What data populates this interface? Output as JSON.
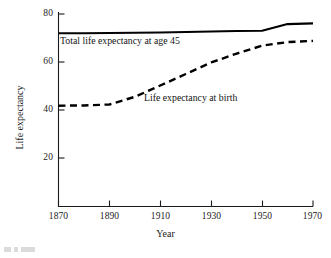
{
  "chart_data": {
    "type": "line",
    "title": "",
    "xlabel": "Year",
    "ylabel": "Life expectancy",
    "xlim": [
      1865,
      1972
    ],
    "ylim": [
      0,
      85
    ],
    "xticks": [
      1870,
      1890,
      1910,
      1930,
      1950,
      1970
    ],
    "xtick_labels": [
      "1870",
      "1890",
      "1910",
      "1930",
      "1950",
      "1970"
    ],
    "yticks": [
      20,
      40,
      60,
      80
    ],
    "ytick_labels": [
      "20",
      "40",
      "60",
      "80"
    ],
    "grid": false,
    "legend_position": "inline-annotation",
    "series": [
      {
        "name": "Total life expectancy at age 45",
        "style": "solid",
        "color": "#000000",
        "annotation": "Total life expectancy at age 45",
        "x": [
          1870,
          1880,
          1890,
          1900,
          1910,
          1920,
          1930,
          1940,
          1950,
          1960,
          1970
        ],
        "values": [
          72.0,
          72.0,
          72.1,
          72.2,
          72.3,
          72.5,
          72.7,
          72.9,
          73.0,
          75.8,
          76.1
        ]
      },
      {
        "name": "Life expectancy at birth",
        "style": "dashed",
        "color": "#000000",
        "annotation": "Life expectancy at birth",
        "x": [
          1870,
          1880,
          1890,
          1900,
          1910,
          1920,
          1930,
          1940,
          1950,
          1960,
          1970
        ],
        "values": [
          41.8,
          41.9,
          42.3,
          45.5,
          50.2,
          55.0,
          59.8,
          63.5,
          66.8,
          68.3,
          68.8
        ]
      }
    ]
  },
  "axis": {
    "ylabel": "Life expectancy",
    "xlabel": "Year"
  }
}
